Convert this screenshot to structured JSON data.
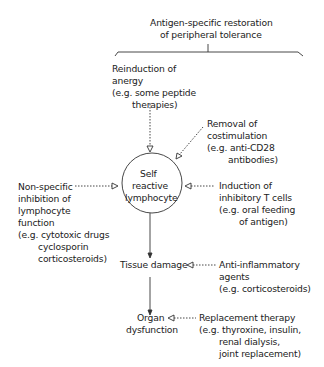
{
  "title": {
    "line1": "Antigen-specific restoration",
    "line2": "of peripheral tolerance"
  },
  "anergy": {
    "l1": "Reinduction of",
    "l2": "anergy",
    "l3": "(e.g. some peptide",
    "l4": "therapies)"
  },
  "costim": {
    "l1": "Removal of",
    "l2": "costimulation",
    "l3": "(e.g. anti-CD28",
    "l4": "antibodies)"
  },
  "center": {
    "l1": "Self",
    "l2": "reactive",
    "l3": "lymphocyte"
  },
  "nonspecific": {
    "l1": "Non-specific",
    "l2": "inhibition of",
    "l3": "lymphocyte",
    "l4": "function",
    "l5": "(e.g. cytotoxic drugs",
    "l6": "cyclosporin",
    "l7": "corticosteroids)"
  },
  "inhibitory": {
    "l1": "Induction of",
    "l2": "inhibitory T cells",
    "l3": "(e.g. oral feeding",
    "l4": "of antigen)"
  },
  "tissue": {
    "label": "Tissue damage"
  },
  "antiinfl": {
    "l1": "Anti-inflammatory",
    "l2": "agents",
    "l3": "(e.g. corticosteroids)"
  },
  "organ": {
    "l1": "Organ",
    "l2": "dysfunction"
  },
  "replacement": {
    "l1": "Replacement therapy",
    "l2": "(e.g. thyroxine, insulin,",
    "l3": "renal dialysis,",
    "l4": "joint replacement)"
  }
}
